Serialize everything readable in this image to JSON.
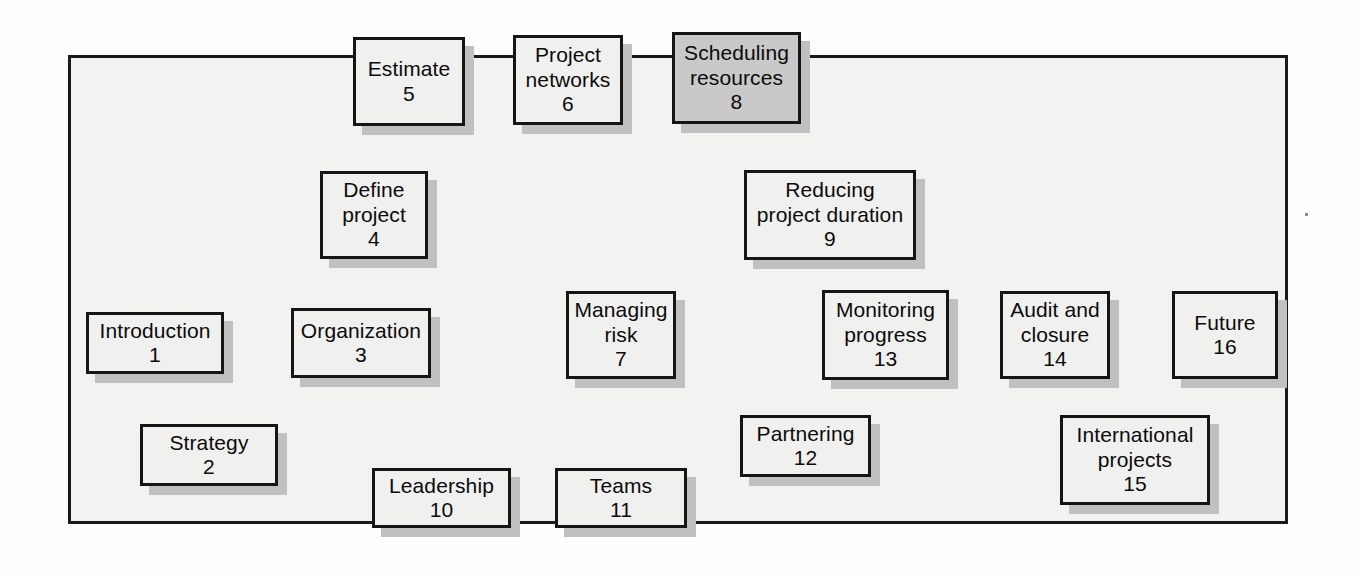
{
  "diagram": {
    "background_color": "#fefefe",
    "frame_fill": "#f2f2f1",
    "frame_border_color": "#1a1a1a",
    "node_fill": "#f0f0ef",
    "node_shaded_fill": "#c9c9c9",
    "node_border_color": "#151515",
    "shadow_color": "#c0c0c0",
    "arrow_color": "#111111",
    "frame": {
      "x": 68,
      "y": 55,
      "w": 1220,
      "h": 469
    },
    "nodes": [
      {
        "id": 1,
        "label": "Introduction",
        "number": "1",
        "x": 86,
        "y": 312,
        "w": 138,
        "h": 62,
        "shaded": false
      },
      {
        "id": 2,
        "label": "Strategy",
        "number": "2",
        "x": 140,
        "y": 424,
        "w": 138,
        "h": 62,
        "shaded": false
      },
      {
        "id": 3,
        "label": "Organization",
        "number": "3",
        "x": 291,
        "y": 308,
        "w": 140,
        "h": 70,
        "shaded": false
      },
      {
        "id": 4,
        "label": "Define\nproject",
        "number": "4",
        "x": 320,
        "y": 171,
        "w": 108,
        "h": 88,
        "shaded": false
      },
      {
        "id": 5,
        "label": "Estimate",
        "number": "5",
        "x": 353,
        "y": 37,
        "w": 112,
        "h": 89,
        "shaded": false
      },
      {
        "id": 6,
        "label": "Project\nnetworks",
        "number": "6",
        "x": 513,
        "y": 35,
        "w": 110,
        "h": 90,
        "shaded": false
      },
      {
        "id": 7,
        "label": "Managing\nrisk",
        "number": "7",
        "x": 566,
        "y": 291,
        "w": 110,
        "h": 88,
        "shaded": false
      },
      {
        "id": 8,
        "label": "Scheduling\nresources",
        "number": "8",
        "x": 672,
        "y": 32,
        "w": 129,
        "h": 92,
        "shaded": true
      },
      {
        "id": 9,
        "label": "Reducing\nproject duration",
        "number": "9",
        "x": 744,
        "y": 170,
        "w": 172,
        "h": 90,
        "shaded": false
      },
      {
        "id": 10,
        "label": "Leadership",
        "number": "10",
        "x": 372,
        "y": 468,
        "w": 139,
        "h": 60,
        "shaded": false
      },
      {
        "id": 11,
        "label": "Teams",
        "number": "11",
        "x": 555,
        "y": 468,
        "w": 132,
        "h": 60,
        "shaded": false
      },
      {
        "id": 12,
        "label": "Partnering",
        "number": "12",
        "x": 740,
        "y": 415,
        "w": 131,
        "h": 62,
        "shaded": false
      },
      {
        "id": 13,
        "label": "Monitoring\nprogress",
        "number": "13",
        "x": 822,
        "y": 290,
        "w": 127,
        "h": 90,
        "shaded": false
      },
      {
        "id": 14,
        "label": "Audit and\nclosure",
        "number": "14",
        "x": 1000,
        "y": 291,
        "w": 110,
        "h": 88,
        "shaded": false
      },
      {
        "id": 15,
        "label": "International\nprojects",
        "number": "15",
        "x": 1060,
        "y": 415,
        "w": 150,
        "h": 90,
        "shaded": false
      },
      {
        "id": 16,
        "label": "Future",
        "number": "16",
        "x": 1172,
        "y": 291,
        "w": 106,
        "h": 88,
        "shaded": false
      }
    ],
    "edges": [
      {
        "from": 1,
        "to": 2,
        "points": "175,374 192,423",
        "style": "straight"
      },
      {
        "from": 2,
        "to": 3,
        "points": "244,424 311,378",
        "style": "straight"
      },
      {
        "from": 3,
        "to": 4,
        "points": "368,308 378,262",
        "style": "straight"
      },
      {
        "from": 4,
        "to": 5,
        "points": "387,171 404,128",
        "style": "straight"
      },
      {
        "from": 5,
        "to": 6,
        "points": "468,81 510,81",
        "style": "straight"
      },
      {
        "from": 6,
        "to": 8,
        "points": "626,81 669,81",
        "style": "straight"
      },
      {
        "from": 6,
        "to": 7,
        "points": "570,126 622,288",
        "style": "straight"
      },
      {
        "from": 8,
        "to": 9,
        "points": "807,126 845,167",
        "style": "straight"
      },
      {
        "from": 9,
        "to": 13,
        "points": "853,261 889,287",
        "style": "straight"
      },
      {
        "from": 7,
        "to": 13,
        "points": "679,335 818,335",
        "style": "straight"
      },
      {
        "from": 3,
        "to": 10,
        "points": "390,380 437,465",
        "style": "straight"
      },
      {
        "from": 10,
        "to": 11,
        "points": "514,498 552,498",
        "style": "straight"
      },
      {
        "from": 11,
        "to": 12,
        "points": "690,497 775,478",
        "style": "straight"
      },
      {
        "from": 12,
        "to": 13,
        "points": "844,413 878,383",
        "style": "straight"
      },
      {
        "from": 13,
        "to": 14,
        "points": "952,335 997,335",
        "style": "straight"
      },
      {
        "from": 14,
        "to": 15,
        "points": "1063,382 1111,412",
        "style": "straight"
      },
      {
        "from": 15,
        "to": 16,
        "points": "1208,413 1223,382",
        "style": "straight"
      }
    ]
  }
}
